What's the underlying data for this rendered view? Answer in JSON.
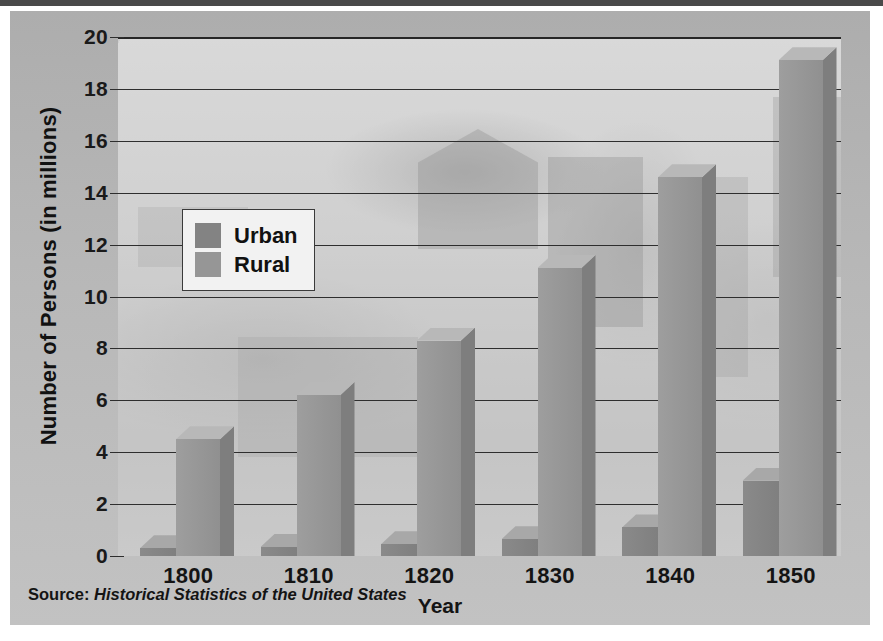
{
  "figure": {
    "source_prefix": "Source:",
    "source_title": "Historical Statistics of the United States"
  },
  "legend": {
    "position": "inside-upper-left",
    "items": [
      {
        "label": "Urban",
        "color": "#838383"
      },
      {
        "label": "Rural",
        "color": "#969696"
      }
    ]
  },
  "colors": {
    "panel": "#b3b3b3",
    "plot": "#cfcfcf",
    "gridline": "#2e2e2e",
    "rural_front": "#979797",
    "rural_top": "#b8b8b8",
    "rural_side": "#7e7e7e",
    "urban_front": "#848484",
    "urban_top": "#a8a8a8",
    "urban_side": "#6e6e6e",
    "text": "#141414"
  },
  "chart_data": {
    "type": "bar",
    "title": "",
    "xlabel": "Year",
    "ylabel": "Number of Persons (in millions)",
    "categories": [
      "1800",
      "1810",
      "1820",
      "1830",
      "1840",
      "1850"
    ],
    "series": [
      {
        "name": "Urban",
        "values": [
          0.3,
          0.35,
          0.45,
          0.65,
          1.1,
          2.9
        ]
      },
      {
        "name": "Rural",
        "values": [
          4.5,
          6.2,
          8.3,
          11.1,
          14.6,
          19.1
        ]
      }
    ],
    "ylim": [
      0,
      20
    ],
    "yticks": [
      0,
      2,
      4,
      6,
      8,
      10,
      12,
      14,
      16,
      18,
      20
    ],
    "ytick_labels": [
      "0",
      "2",
      "4",
      "6",
      "8",
      "10",
      "12",
      "14",
      "16",
      "18",
      "20"
    ],
    "grid": true,
    "grid_axis": "y",
    "legend_entries": [
      "Urban",
      "Rural"
    ],
    "style": "3d-columns",
    "annotations": [
      "Source: Historical Statistics of the United States"
    ]
  }
}
